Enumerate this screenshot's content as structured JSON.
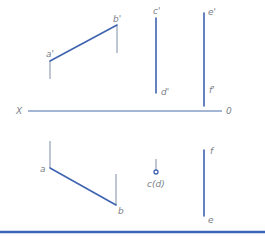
{
  "diagram": {
    "type": "orthographic-projection",
    "axis": {
      "left_label": "X",
      "right_label": "0"
    },
    "front_view": {
      "line_ab": {
        "start_label": "a'",
        "end_label": "b'"
      },
      "line_cd": {
        "top_label": "c'",
        "bottom_label": "d'"
      },
      "line_ef": {
        "top_label": "e'",
        "bottom_label": "f'"
      }
    },
    "top_view": {
      "line_ab": {
        "start_label": "a",
        "end_label": "b"
      },
      "point_cd": {
        "label": "c(d)"
      },
      "line_ef": {
        "top_label": "f",
        "bottom_label": "e"
      }
    },
    "colors": {
      "line": "#3f63b0",
      "label": "#7a8088",
      "rule": "#3a65b8"
    }
  }
}
